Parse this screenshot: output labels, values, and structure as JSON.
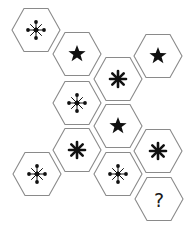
{
  "puzzle": {
    "description": "Hexagon symbol sequence puzzle",
    "stroke_color": "#8a8a8a",
    "symbol_color": "#111111",
    "hexagons": [
      {
        "id": 1,
        "cx": 36,
        "cy": 30,
        "symbol": "snowflake"
      },
      {
        "id": 2,
        "cx": 77,
        "cy": 54,
        "symbol": "star"
      },
      {
        "id": 3,
        "cx": 158,
        "cy": 56,
        "symbol": "star"
      },
      {
        "id": 4,
        "cx": 118,
        "cy": 79,
        "symbol": "asterisk"
      },
      {
        "id": 5,
        "cx": 77,
        "cy": 103,
        "symbol": "snowflake"
      },
      {
        "id": 6,
        "cx": 118,
        "cy": 126,
        "symbol": "star"
      },
      {
        "id": 7,
        "cx": 77,
        "cy": 150,
        "symbol": "asterisk"
      },
      {
        "id": 8,
        "cx": 158,
        "cy": 151,
        "symbol": "asterisk"
      },
      {
        "id": 9,
        "cx": 37,
        "cy": 174,
        "symbol": "snowflake"
      },
      {
        "id": 10,
        "cx": 118,
        "cy": 174,
        "symbol": "snowflake"
      },
      {
        "id": 11,
        "cx": 159,
        "cy": 199,
        "symbol": "question",
        "text": "?"
      }
    ]
  }
}
